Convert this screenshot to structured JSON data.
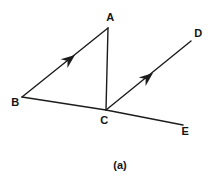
{
  "figure": {
    "caption": "(a)",
    "colors": {
      "background": "#ffffff",
      "line": "#1c1c1c",
      "text": "#141414"
    },
    "vertex_labels": {
      "A": "A",
      "B": "B",
      "C": "C",
      "D": "D",
      "E": "E"
    },
    "geometry": {
      "points_px": {
        "A": [
          108,
          28
        ],
        "B": [
          22,
          97
        ],
        "C": [
          106,
          110
        ],
        "D": [
          191,
          41
        ],
        "E": [
          183,
          125
        ]
      },
      "segments": [
        "B-A",
        "A-C",
        "B-C",
        "C-E",
        "C-D"
      ],
      "arrow_marks": [
        {
          "on": "B-A",
          "tip_px": [
            75,
            55
          ],
          "direction": "toward A"
        },
        {
          "on": "C-D",
          "tip_px": [
            153,
            73
          ],
          "direction": "toward D"
        }
      ]
    }
  }
}
